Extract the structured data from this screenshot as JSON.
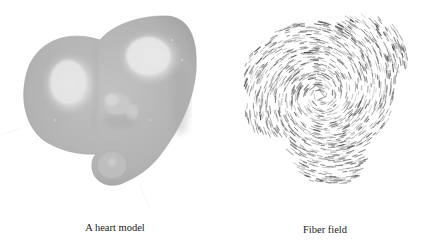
{
  "figure": {
    "panels": [
      {
        "id": "heart-model",
        "caption": "A heart model",
        "render": "gray shaded 3D surface",
        "colors": {
          "surface": "#b4b4b4",
          "surface_dark": "#a2a2a2",
          "highlight": "#dedede",
          "edge": "#9c9c9c"
        }
      },
      {
        "id": "fiber-field",
        "caption": "Fiber field",
        "render": "short dark strokes swirling around a center",
        "colors": {
          "stroke": "#555555"
        },
        "swirl": {
          "center": [
            107,
            95
          ],
          "count": 1300,
          "seed": 7
        }
      }
    ]
  }
}
